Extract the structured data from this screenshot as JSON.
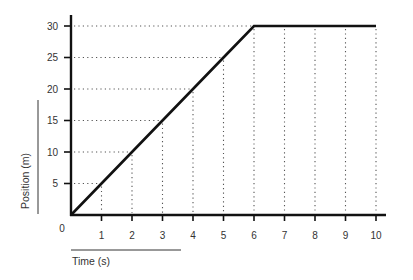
{
  "chart_data": {
    "type": "line",
    "title": "",
    "xlabel": "Time (s)",
    "ylabel": "Position (m)",
    "origin_label": "0",
    "x_ticks": [
      "1",
      "2",
      "3",
      "4",
      "5",
      "6",
      "7",
      "8",
      "9",
      "10"
    ],
    "y_ticks": [
      "5",
      "10",
      "15",
      "20",
      "25",
      "30"
    ],
    "xlim": [
      0,
      10
    ],
    "ylim": [
      0,
      30
    ],
    "grid": "dotted guide lines from data points to axes",
    "legend": "none",
    "series": [
      {
        "name": "Position",
        "x": [
          0,
          1,
          2,
          3,
          4,
          5,
          6,
          7,
          8,
          9,
          10
        ],
        "y": [
          0,
          5,
          10,
          15,
          20,
          25,
          30,
          30,
          30,
          30,
          30
        ]
      }
    ],
    "colors": {
      "line": "#111111",
      "axis": "#111111",
      "grid": "#555555",
      "text": "#333333"
    }
  }
}
